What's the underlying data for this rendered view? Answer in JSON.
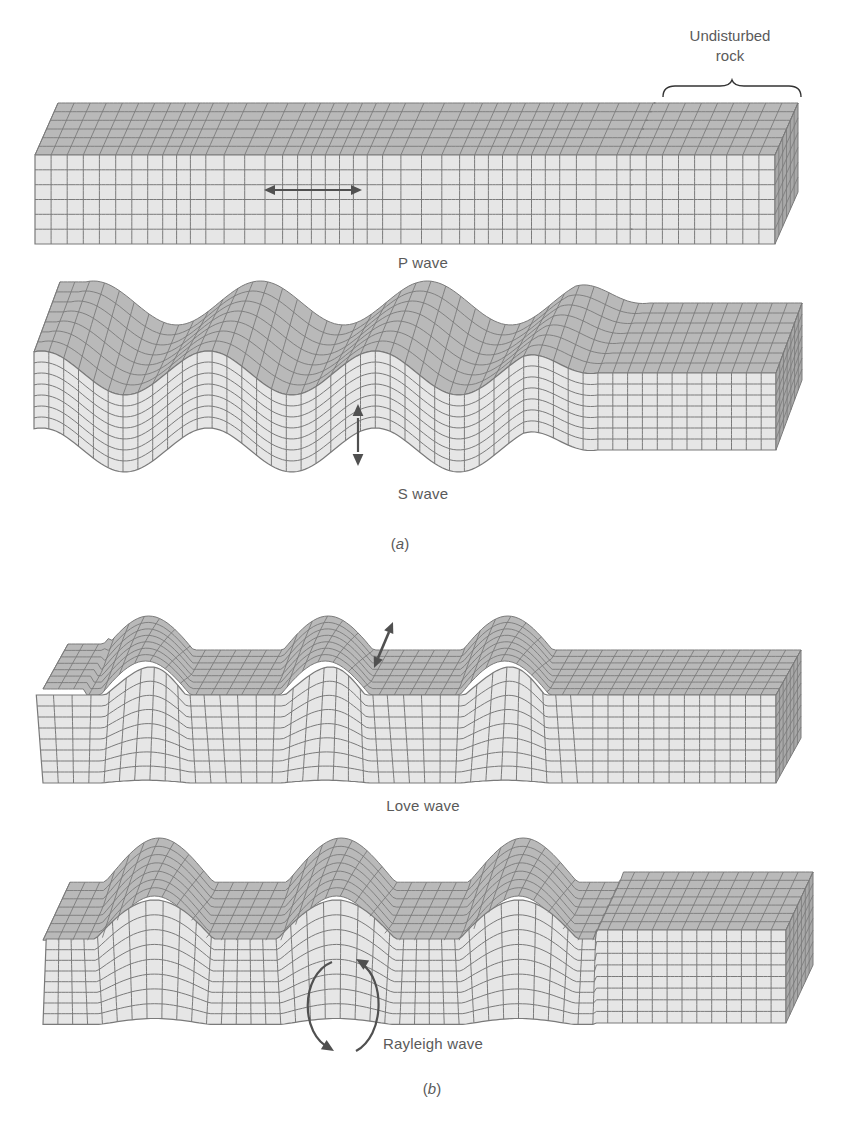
{
  "figure": {
    "annotation": {
      "line1": "Undisturbed",
      "line2": "rock"
    },
    "part_a": {
      "label_open": "(",
      "label_letter": "a",
      "label_close": ")",
      "panels": [
        {
          "id": "p-wave",
          "caption": "P wave",
          "motion": "horizontal compression arrow (left-right)"
        },
        {
          "id": "s-wave",
          "caption": "S wave",
          "motion": "vertical arrow (up-down)"
        }
      ]
    },
    "part_b": {
      "label_open": "(",
      "label_letter": "b",
      "label_close": ")",
      "panels": [
        {
          "id": "love-wave",
          "caption": "Love wave",
          "motion": "horizontal transverse arrow (side-to-side)"
        },
        {
          "id": "rayleigh-wave",
          "caption": "Rayleigh wave",
          "motion": "elliptical rotating arrows"
        }
      ]
    },
    "colors": {
      "front_face": "#e6e6e6",
      "top_face": "#b9b9b9",
      "side_face": "#a8a8a8",
      "grid_line": "#7a7a7a",
      "arrow": "#505050",
      "text": "#5a5a5a"
    }
  }
}
